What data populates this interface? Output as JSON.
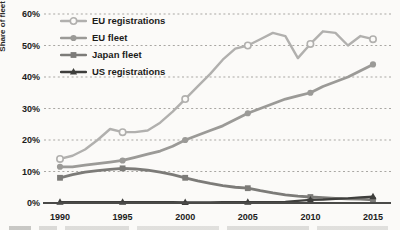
{
  "page": {
    "background": "#fbfaf8"
  },
  "chart_data": {
    "type": "line",
    "title": "",
    "xlabel": "",
    "ylabel": "Share of fleet and new registrations",
    "x": [
      1990,
      1991,
      1992,
      1993,
      1994,
      1995,
      1996,
      1997,
      1998,
      1999,
      2000,
      2001,
      2002,
      2003,
      2004,
      2005,
      2006,
      2007,
      2008,
      2009,
      2010,
      2011,
      2012,
      2013,
      2014,
      2015
    ],
    "x_ticks": [
      "1990",
      "1995",
      "2000",
      "2005",
      "2010",
      "2015"
    ],
    "y_ticks": [
      "0%",
      "10%",
      "20%",
      "30%",
      "40%",
      "50%",
      "60%"
    ],
    "ylim": [
      0,
      60
    ],
    "xlim": [
      1988.6,
      2016.4
    ],
    "grid": "horizontal-dashed",
    "legend_position": "top-left",
    "colors": {
      "background": "#fbfaf8",
      "grid": "#a9a7a3",
      "axis": "#4a4a48",
      "text": "#1c1c1a"
    },
    "series": [
      {
        "name": "EU registrations",
        "color": "#b1b0ae",
        "marker": "open-circle",
        "line_width": 2.4,
        "marker_x": [
          1990,
          1995,
          2000,
          2005,
          2010,
          2015
        ],
        "values": [
          14,
          15,
          17,
          20,
          23.5,
          22.5,
          22.5,
          23,
          25.5,
          29,
          33,
          37,
          41,
          45.5,
          49,
          50,
          52,
          54,
          53,
          46,
          50.5,
          54.5,
          54,
          50,
          53,
          52
        ]
      },
      {
        "name": "EU fleet",
        "color": "#9b9a97",
        "marker": "filled-circle",
        "line_width": 2.8,
        "marker_x": [
          1990,
          1995,
          2000,
          2005,
          2010,
          2015
        ],
        "values": [
          11.5,
          11.5,
          12,
          12.5,
          13,
          13.5,
          14.5,
          15.5,
          16.5,
          18,
          20,
          21.5,
          23,
          24.5,
          26.5,
          28.5,
          30,
          31.5,
          33,
          34,
          35,
          37,
          38.5,
          40,
          42,
          44
        ]
      },
      {
        "name": "Japan fleet",
        "color": "#7c7b78",
        "marker": "filled-square",
        "line_width": 2.8,
        "marker_x": [
          1990,
          1995,
          2000,
          2005,
          2010,
          2015
        ],
        "values": [
          8,
          9,
          9.8,
          10.3,
          10.7,
          11,
          10.8,
          10.4,
          9.8,
          9,
          8,
          7,
          6.2,
          5.5,
          5,
          4.7,
          3.9,
          3.2,
          2.6,
          2.2,
          1.9,
          1.7,
          1.5,
          1.3,
          1.2,
          1
        ]
      },
      {
        "name": "US registrations",
        "color": "#3e3e3c",
        "marker": "filled-triangle",
        "line_width": 2.2,
        "marker_x": [
          1990,
          1995,
          2000,
          2005,
          2010,
          2015
        ],
        "values": [
          0.3,
          0.3,
          0.3,
          0.3,
          0.3,
          0.3,
          0.3,
          0.3,
          0.3,
          0.3,
          0.2,
          0.2,
          0.2,
          0.3,
          0.3,
          0.3,
          0.3,
          0.3,
          0.4,
          0.7,
          1,
          1.1,
          1.3,
          1.5,
          1.8,
          2
        ]
      }
    ]
  }
}
